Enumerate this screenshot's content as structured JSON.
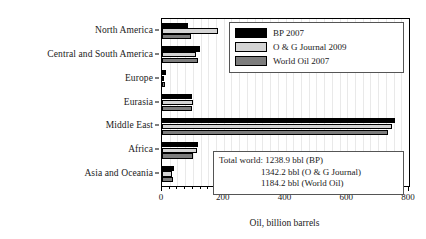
{
  "chart_data": {
    "type": "bar",
    "orientation": "horizontal",
    "title": "",
    "xlabel": "Oil, billion barrels",
    "ylabel": "",
    "xlim": [
      0,
      800
    ],
    "xticks": [
      0,
      200,
      400,
      600,
      800
    ],
    "xticklabels": [
      "0",
      "200",
      "400",
      "600",
      "800"
    ],
    "minor_tick_interval": 25,
    "grid": "vertical-light",
    "legend_position": "upper right",
    "categories": [
      "North America",
      "Central and South America",
      "Europe",
      "Eurasia",
      "Middle East",
      "Africa",
      "Asia and Oceania"
    ],
    "series": [
      {
        "name": "BP 2007",
        "color": "#000000",
        "values": [
          85,
          123,
          14,
          98,
          755,
          117,
          40
        ]
      },
      {
        "name": "O & G Journal 2009",
        "color": "#d4d4d4",
        "values": [
          180,
          111,
          6,
          99,
          745,
          114,
          34
        ]
      },
      {
        "name": "World Oil 2007",
        "color": "#7d7d7d",
        "values": [
          95,
          116,
          9,
          98,
          731,
          100,
          35
        ]
      }
    ],
    "annotation": {
      "lines": [
        "Total world: 1238.9 bbl (BP)",
        "1342.2 bbl (O & G Journal)",
        "1184.2 bbl (World Oil)"
      ]
    }
  }
}
